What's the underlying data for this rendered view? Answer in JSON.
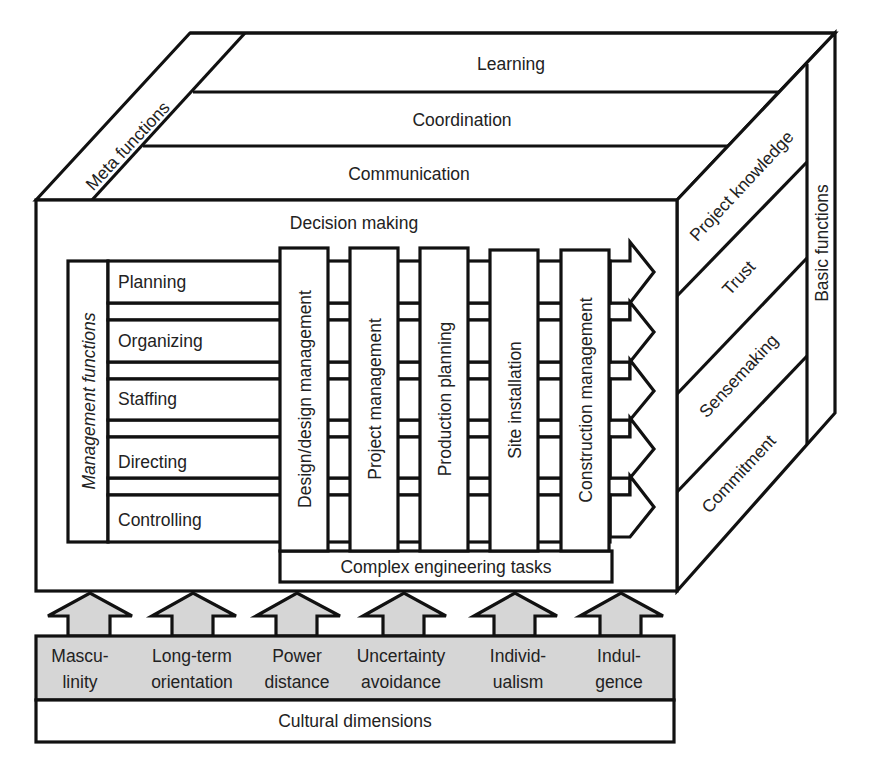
{
  "meta_functions": {
    "label": "Meta functions",
    "bands": [
      "Learning",
      "Coordination",
      "Communication"
    ]
  },
  "front_box": {
    "title": "Decision making"
  },
  "management_functions": {
    "label": "Management functions",
    "rows": [
      "Planning",
      "Organizing",
      "Staffing",
      "Directing",
      "Controlling"
    ]
  },
  "process_columns": [
    "Design/design management",
    "Project management",
    "Production planning",
    "Site installation",
    "Construction management"
  ],
  "complex_tasks": {
    "label": "Complex engineering tasks"
  },
  "basic_functions": {
    "label": "Basic functions",
    "items": [
      "Project knowledge",
      "Trust",
      "Sensemaking",
      "Commitment"
    ]
  },
  "cultural_dimensions": {
    "label": "Cultural dimensions",
    "items": [
      {
        "line1": "Mascu-",
        "line2": "linity"
      },
      {
        "line1": "Long-term",
        "line2": "orientation"
      },
      {
        "line1": "Power",
        "line2": "distance"
      },
      {
        "line1": "Uncertainty",
        "line2": "avoidance"
      },
      {
        "line1": "Individ-",
        "line2": "ualism"
      },
      {
        "line1": "Indul-",
        "line2": "gence"
      }
    ]
  },
  "colors": {
    "line": "#111111",
    "fill_gray": "#d6d6d6",
    "background": "#ffffff"
  }
}
